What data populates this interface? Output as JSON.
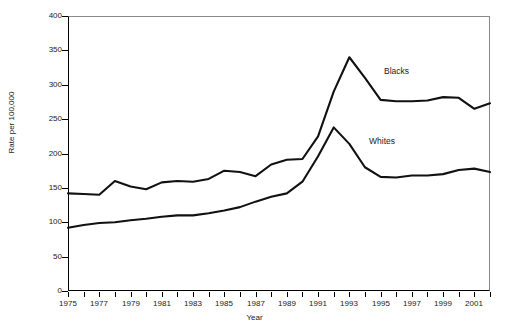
{
  "chart_data": {
    "type": "line",
    "title": "",
    "xlabel": "Year",
    "ylabel": "Rate per 100,000",
    "xlim": [
      1975,
      2002
    ],
    "ylim": [
      0,
      400
    ],
    "grid": false,
    "legend_position": "inline-annotation",
    "x": [
      1975,
      1976,
      1977,
      1978,
      1979,
      1980,
      1981,
      1982,
      1983,
      1984,
      1985,
      1986,
      1987,
      1988,
      1989,
      1990,
      1991,
      1992,
      1993,
      1994,
      1995,
      1996,
      1997,
      1998,
      1999,
      2000,
      2001,
      2002
    ],
    "x_tick_labels": [
      "1975",
      "1977",
      "1979",
      "1981",
      "1983",
      "1985",
      "1987",
      "1989",
      "1991",
      "1993",
      "1995",
      "1997",
      "1999",
      "2001"
    ],
    "y_tick_labels": [
      "0",
      "50",
      "100",
      "150",
      "200",
      "250",
      "300",
      "350",
      "400"
    ],
    "y_ticks": [
      0,
      50,
      100,
      150,
      200,
      250,
      300,
      350,
      400
    ],
    "series": [
      {
        "name": "Blacks",
        "label_text": "Blacks",
        "color": "#111111",
        "values": [
          142,
          141,
          140,
          160,
          152,
          148,
          158,
          160,
          159,
          163,
          175,
          173,
          167,
          184,
          191,
          192,
          225,
          290,
          340,
          310,
          278,
          276,
          276,
          277,
          282,
          281,
          265,
          273
        ]
      },
      {
        "name": "Whites",
        "label_text": "Whites",
        "color": "#111111",
        "values": [
          92,
          96,
          99,
          100,
          103,
          105,
          108,
          110,
          110,
          113,
          117,
          122,
          130,
          137,
          142,
          159,
          196,
          238,
          214,
          180,
          166,
          165,
          168,
          168,
          170,
          176,
          178,
          173
        ]
      }
    ]
  }
}
